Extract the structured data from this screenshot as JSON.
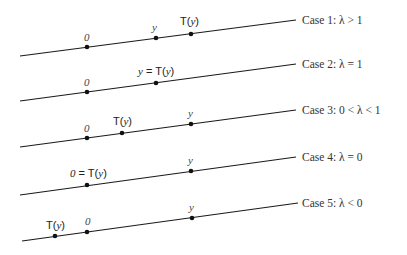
{
  "diagram": {
    "colors": {
      "line": "#1a1a1a",
      "text": "#333333",
      "background": "#ffffff"
    },
    "cases": [
      {
        "label": "Case 1:  λ > 1",
        "line": {
          "x1": 20,
          "y1": 56,
          "x2": 296,
          "y2": 20
        },
        "label_pos": {
          "x": 302,
          "y": 24
        },
        "points": [
          {
            "name": "zero",
            "x": 87,
            "y": 47,
            "label": "0",
            "style": "italic",
            "lx": 84,
            "ly": 41
          },
          {
            "name": "y",
            "x": 156,
            "y": 38,
            "label": "y",
            "style": "italic",
            "lx": 152,
            "ly": 31
          },
          {
            "name": "T-of-y",
            "x": 191,
            "y": 34,
            "label": "T(y)",
            "style": "T",
            "lx": 180,
            "ly": 25
          }
        ]
      },
      {
        "label": "Case 2:  λ = 1",
        "line": {
          "x1": 20,
          "y1": 101,
          "x2": 296,
          "y2": 64
        },
        "label_pos": {
          "x": 302,
          "y": 68
        },
        "points": [
          {
            "name": "zero",
            "x": 87,
            "y": 92,
            "label": "0",
            "style": "italic",
            "lx": 84,
            "ly": 86
          },
          {
            "name": "y-equals-T-of-y",
            "x": 156,
            "y": 83,
            "label": "y = T(y)",
            "style": "T",
            "lx": 138,
            "ly": 75
          }
        ]
      },
      {
        "label": "Case 3:  0 < λ < 1",
        "line": {
          "x1": 20,
          "y1": 147,
          "x2": 296,
          "y2": 110
        },
        "label_pos": {
          "x": 302,
          "y": 114
        },
        "points": [
          {
            "name": "zero",
            "x": 87,
            "y": 138,
            "label": "0",
            "style": "italic",
            "lx": 84,
            "ly": 132
          },
          {
            "name": "T-of-y",
            "x": 122,
            "y": 133,
            "label": "T(y)",
            "style": "T",
            "lx": 113,
            "ly": 125
          },
          {
            "name": "y",
            "x": 191,
            "y": 124,
            "label": "y",
            "style": "italic",
            "lx": 188,
            "ly": 117
          }
        ]
      },
      {
        "label": "Case 4:  λ = 0",
        "line": {
          "x1": 20,
          "y1": 195,
          "x2": 296,
          "y2": 157
        },
        "label_pos": {
          "x": 302,
          "y": 161
        },
        "points": [
          {
            "name": "zero-equals-T-of-y",
            "x": 87,
            "y": 185,
            "label": "0 = T(y)",
            "style": "T",
            "lx": 70,
            "ly": 177
          },
          {
            "name": "y",
            "x": 191,
            "y": 171,
            "label": "y",
            "style": "italic",
            "lx": 188,
            "ly": 164
          }
        ]
      },
      {
        "label": "Case 5:  λ < 0",
        "line": {
          "x1": 22,
          "y1": 241,
          "x2": 298,
          "y2": 203
        },
        "label_pos": {
          "x": 302,
          "y": 207
        },
        "points": [
          {
            "name": "T-of-y",
            "x": 55,
            "y": 236,
            "label": "T(y)",
            "style": "T",
            "lx": 46,
            "ly": 229
          },
          {
            "name": "zero",
            "x": 87,
            "y": 232,
            "label": "0",
            "style": "italic",
            "lx": 85,
            "ly": 225
          },
          {
            "name": "y",
            "x": 192,
            "y": 218,
            "label": "y",
            "style": "italic",
            "lx": 189,
            "ly": 211
          }
        ]
      }
    ]
  }
}
